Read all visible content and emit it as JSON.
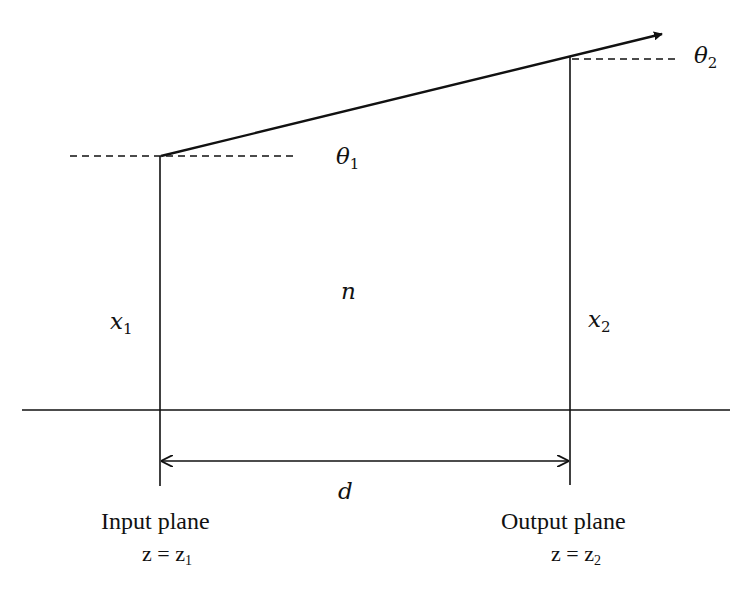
{
  "diagram": {
    "type": "ray-transfer-free-space-propagation",
    "colors": {
      "stroke": "#111111",
      "background": "#ffffff"
    },
    "labels": {
      "theta1": {
        "base": "θ",
        "sub": "1"
      },
      "theta2": {
        "base": "θ",
        "sub": "2"
      },
      "x1": {
        "base": "x",
        "sub": "1"
      },
      "x2": {
        "base": "x",
        "sub": "2"
      },
      "n": "n",
      "d": "d",
      "input_plane": "Input plane",
      "output_plane": "Output plane",
      "input_eq": {
        "lhs": "z = z",
        "sub": "1"
      },
      "output_eq": {
        "lhs": "z = z",
        "sub": "2"
      }
    }
  }
}
